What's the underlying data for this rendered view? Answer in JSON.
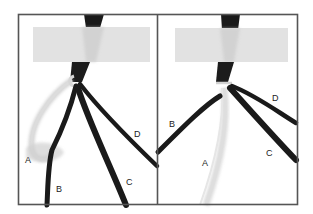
{
  "figure": {
    "panels": [
      {
        "id": "left",
        "labels": {
          "A": "A",
          "B": "B",
          "C": "C",
          "D": "D"
        }
      },
      {
        "id": "right",
        "labels": {
          "A": "A",
          "B": "B",
          "C": "C",
          "D": "D"
        }
      }
    ],
    "colors": {
      "frame": "#555555",
      "tape": "#e2e2e2",
      "dark_cord": "#1a1a1a",
      "light_cord": "#d8d8d8",
      "background": "#ffffff"
    }
  }
}
